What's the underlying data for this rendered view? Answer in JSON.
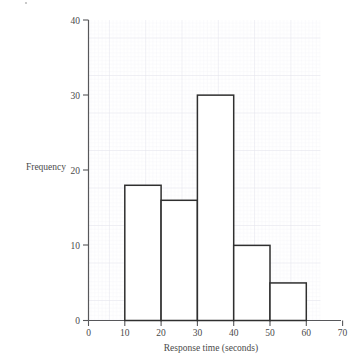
{
  "chart_data": {
    "type": "bar",
    "subtype": "histogram",
    "title": "",
    "xlabel": "Response time (seconds)",
    "ylabel": "Frequency",
    "xlim": [
      0,
      70
    ],
    "ylim": [
      0,
      40
    ],
    "xticks": [
      0,
      10,
      20,
      30,
      40,
      50,
      60,
      70
    ],
    "yticks": [
      0,
      10,
      20,
      30,
      40
    ],
    "xtick_labels": [
      "0",
      "10",
      "20",
      "30",
      "40",
      "50",
      "60",
      "70"
    ],
    "ytick_labels": [
      "0",
      "10",
      "20",
      "30",
      "40"
    ],
    "bin_width": 10,
    "grid": true,
    "grid_style": "graph-paper minor 2px major 10px",
    "legend": "none",
    "bins": [
      {
        "label": "10-20",
        "x0": 10,
        "x1": 20,
        "value": 18
      },
      {
        "label": "20-30",
        "x0": 20,
        "x1": 30,
        "value": 16
      },
      {
        "label": "30-40",
        "x0": 30,
        "x1": 40,
        "value": 30
      },
      {
        "label": "40-50",
        "x0": 40,
        "x1": 50,
        "value": 10
      },
      {
        "label": "50-60",
        "x0": 50,
        "x1": 60,
        "value": 5
      }
    ],
    "categories": [
      "10-20",
      "20-30",
      "30-40",
      "40-50",
      "50-60"
    ],
    "values": [
      18,
      16,
      30,
      10,
      5
    ],
    "colors": {
      "bar_fill": "#ffffff",
      "bar_stroke": "#2f2f2f",
      "axis": "#57575a",
      "text": "#4a4a4a",
      "grid_minor": "#efeff4",
      "grid_major": "#e2e2ea",
      "background": "#ffffff"
    }
  }
}
